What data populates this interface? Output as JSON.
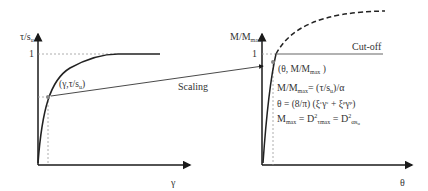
{
  "left_plot": {
    "y_axis_label": "τ/s",
    "y_axis_sub": "u",
    "x_axis_label": "γ",
    "y_tick": "1",
    "point_label_main": "(γ,τ/s",
    "point_label_sub": "u",
    "point_label_end": ")"
  },
  "arrow": {
    "label": "Scaling"
  },
  "right_plot": {
    "y_axis_label": "M/M",
    "y_axis_sub": "max",
    "x_axis_label": "θ",
    "y_tick": "1",
    "cutoff_label": "Cut-off",
    "point_label": "(θ,  M/M",
    "point_label_sub": "max",
    "point_label_end": " )",
    "eq1_a": "M/M",
    "eq1_sub": "max",
    "eq1_b": "= (τ/s",
    "eq1_sub2": "u",
    "eq1_c": ")/α",
    "eq2": "θ = (8/π) (ξ",
    "eq2_sub1": "e",
    "eq2_sup1": "e",
    "eq2_mid": "γ",
    "eq2_plus": " + ξ",
    "eq2_sub2": "p",
    "eq2_sup2": "p",
    "eq2_end": ")",
    "eq3_a": "M",
    "eq3_sub": "max",
    "eq3_b": " = D",
    "eq3_sup": "2",
    "eq3_tau": "τ",
    "eq3_tausub": "max",
    "eq3_c": " = D",
    "eq3_sup2": "2",
    "eq3_d": "αs",
    "eq3_dsub": "u"
  },
  "colors": {
    "axis": "#1a1a1a",
    "curve": "#222222",
    "guide": "#999999",
    "cutoff": "#666666",
    "point": "#888888"
  }
}
